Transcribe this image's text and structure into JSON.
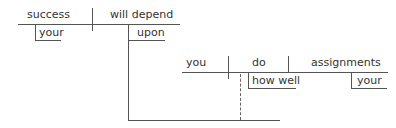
{
  "diagram": {
    "type": "sentence-diagram",
    "main_clause": {
      "subject": "success",
      "subject_modifier": "your",
      "verb": "will depend",
      "preposition": "upon"
    },
    "noun_clause": {
      "subject": "you",
      "verb": "do",
      "adverb_modifier": "how well",
      "object": "assignments",
      "object_modifier": "your"
    },
    "colors": {
      "line": "#555555",
      "text": "#333333"
    }
  }
}
